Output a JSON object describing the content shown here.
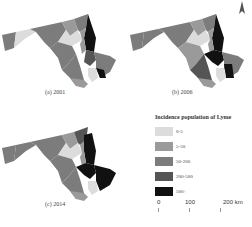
{
  "maps": [
    {
      "id": "a",
      "caption": "(a) 2001"
    },
    {
      "id": "b",
      "caption": "(b) 2006"
    },
    {
      "id": "c",
      "caption": "(c) 2014"
    }
  ],
  "north_arrow": {
    "label": "N"
  },
  "legend": {
    "title": "Incidence population of Lyme",
    "classes": [
      {
        "label": "0-5",
        "color": "#dcdcdc"
      },
      {
        "label": "5-50",
        "color": "#9a9a9a"
      },
      {
        "label": "50-200",
        "color": "#7c7c7c"
      },
      {
        "label": "200-500",
        "color": "#555555"
      },
      {
        "label": "500+",
        "color": "#111111"
      }
    ]
  },
  "scale_bar": {
    "ticks": [
      "0",
      "100",
      "200 km"
    ]
  }
}
